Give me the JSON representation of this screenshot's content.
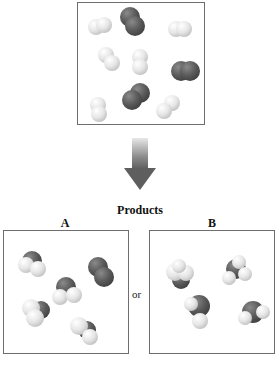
{
  "reactants": {
    "molecules": [
      {
        "type": "H2",
        "x": 18,
        "y": 22,
        "angle": -20
      },
      {
        "type": "O2",
        "x": 58,
        "y": 14,
        "angle": 70
      },
      {
        "type": "H2",
        "x": 100,
        "y": 26,
        "angle": 0
      },
      {
        "type": "H2",
        "x": 28,
        "y": 52,
        "angle": 30
      },
      {
        "type": "H2",
        "x": 64,
        "y": 50,
        "angle": 90
      },
      {
        "type": "O2",
        "x": 104,
        "y": 66,
        "angle": 10
      },
      {
        "type": "O2",
        "x": 60,
        "y": 90,
        "angle": -30
      },
      {
        "type": "H2",
        "x": 22,
        "y": 100,
        "angle": 80
      },
      {
        "type": "H2",
        "x": 90,
        "y": 102,
        "angle": -40
      }
    ]
  },
  "arrow": {
    "direction": "down",
    "color": "#6e6e6e"
  },
  "products_title": "Products",
  "option_a": {
    "label": "A",
    "molecules": [
      "H2O",
      "H2O",
      "O2",
      "H2O",
      "H2O"
    ]
  },
  "separator": "or",
  "option_b": {
    "label": "B",
    "molecules": [
      "H2O",
      "H2O",
      "H2O",
      "H2O"
    ]
  },
  "colors": {
    "hydrogen": "#e6e6e6",
    "oxygen": "#5a5a5a",
    "border": "#6e6e6e"
  }
}
